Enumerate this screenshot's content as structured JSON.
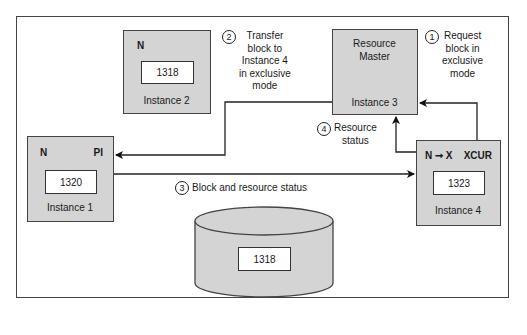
{
  "diagram": {
    "instance1": {
      "name": "Instance 1",
      "state_left": "N",
      "state_right": "PI",
      "block": "1320"
    },
    "instance2": {
      "name": "Instance 2",
      "state_left": "N",
      "block": "1318"
    },
    "instance3": {
      "name": "Instance 3",
      "role_line1": "Resource",
      "role_line2": "Master"
    },
    "instance4": {
      "name": "Instance 4",
      "state_left": "N ➞ X",
      "state_right": "XCUR",
      "block": "1323"
    },
    "disk": {
      "block": "1318"
    },
    "steps": [
      {
        "number": "1",
        "lines": [
          "Request",
          "block in",
          "exclusive",
          "mode"
        ]
      },
      {
        "number": "2",
        "lines": [
          "Transfer",
          "block to",
          "Instance 4",
          "in exclusive",
          "mode"
        ]
      },
      {
        "number": "3",
        "lines": [
          "Block and resource status"
        ]
      },
      {
        "number": "4",
        "lines": [
          "Resource",
          "status"
        ]
      }
    ]
  }
}
